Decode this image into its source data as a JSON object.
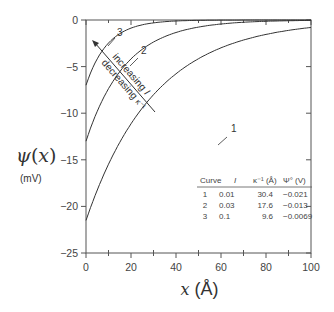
{
  "chart_data": {
    "type": "line",
    "title": "",
    "xlabel": "x (Å)",
    "ylabel": "ψ(x)",
    "ylabel_unit": "(mV)",
    "xlim": [
      0,
      100
    ],
    "ylim": [
      -25,
      0
    ],
    "x_ticks": [
      "0",
      "20",
      "40",
      "60",
      "80",
      "100"
    ],
    "y_ticks": [
      "0",
      "-5",
      "-10",
      "-15",
      "-20",
      "-25"
    ],
    "grid": false,
    "series": [
      {
        "name": "1",
        "psi0_mV": -21.5,
        "debye_length_A": 30.4,
        "x": [
          0,
          10,
          20,
          30,
          40,
          50,
          60,
          70,
          80,
          90,
          100
        ],
        "y": [
          -21.5,
          -15.5,
          -11.1,
          -8.0,
          -5.8,
          -4.2,
          -3.0,
          -2.1,
          -1.5,
          -1.1,
          -0.8
        ]
      },
      {
        "name": "2",
        "psi0_mV": -13.0,
        "debye_length_A": 17.6,
        "x": [
          0,
          10,
          20,
          30,
          40,
          50,
          60,
          70,
          80,
          90,
          100
        ],
        "y": [
          -13.0,
          -7.4,
          -4.2,
          -2.4,
          -1.3,
          -0.8,
          -0.4,
          -0.2,
          -0.1,
          -0.1,
          0.0
        ]
      },
      {
        "name": "3",
        "psi0_mV": -7.0,
        "debye_length_A": 9.6,
        "x": [
          0,
          10,
          20,
          30,
          40,
          50,
          60,
          70,
          80,
          90,
          100
        ],
        "y": [
          -7.0,
          -2.5,
          -0.9,
          -0.3,
          -0.1,
          0.0,
          0.0,
          0.0,
          0.0,
          0.0,
          0.0
        ]
      }
    ],
    "annotations": {
      "arrow_text_1": "increasing I",
      "arrow_text_2": "decreasing κ⁻¹"
    },
    "table": {
      "headers": [
        "Curve",
        "I",
        "κ⁻¹ (Å)",
        "Ψ° (V)"
      ],
      "rows": [
        [
          "1",
          "0.01",
          "30.4",
          "-0.021"
        ],
        [
          "2",
          "0.03",
          "17.6",
          "-0.013"
        ],
        [
          "3",
          "0.1",
          "9.6",
          "-0.0069"
        ]
      ]
    }
  }
}
